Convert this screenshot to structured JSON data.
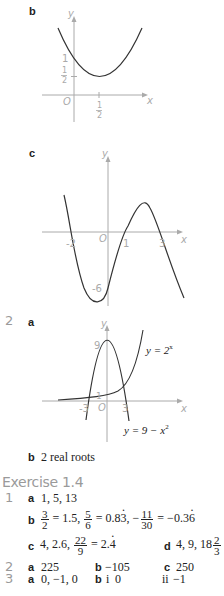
{
  "part_b_graph": {
    "label": "b",
    "y_axis_label": "y",
    "x_axis_label": "x",
    "origin_label": "O",
    "y_tick_1": "1",
    "y_tick_half_num": "1",
    "y_tick_half_den": "2",
    "x_tick_half_num": "1",
    "x_tick_half_den": "2"
  },
  "part_c_graph": {
    "label": "c",
    "y_axis_label": "y",
    "x_axis_label": "x",
    "origin_label": "O",
    "x_ticks": [
      "-2",
      "1",
      "3"
    ],
    "y_tick": "-6"
  },
  "question_2": {
    "number": "2",
    "part_a_label": "a",
    "graph": {
      "y_axis_label": "y",
      "x_axis_label": "x",
      "origin_label": "O",
      "y_tick_9": "9",
      "y_tick_1": "1",
      "x_tick_neg3": "-3",
      "x_tick_3": "3",
      "curve1_label": "y = 2",
      "curve1_sup": "x",
      "curve2_label": "y = 9 − x",
      "curve2_sup": "2"
    },
    "part_b_label": "b",
    "part_b_answer": "2 real roots"
  },
  "exercise": {
    "title": "Exercise 1.4",
    "q1": {
      "number": "1",
      "a_label": "a",
      "a_answer": "1, 5, 13",
      "b_label": "b",
      "b_f1_num": "3",
      "b_f1_den": "2",
      "b_f1_val": " = 1.5, ",
      "b_f2_num": "5",
      "b_f2_den": "6",
      "b_f2_val_pre": " = 0.8",
      "b_f2_val_dot": "3",
      "b_f2_sep": ", −",
      "b_f3_num": "11",
      "b_f3_den": "30",
      "b_f3_val_pre": " = −0.3",
      "b_f3_val_dot": "6",
      "c_label": "c",
      "c_pre": "4, 2.6, ",
      "c_f_num": "22",
      "c_f_den": "9",
      "c_val_pre": " = 2.",
      "c_val_dot": "4",
      "d_label": "d",
      "d_pre": "4, 9, 18",
      "d_f_num": "2",
      "d_f_den": "3"
    },
    "q2": {
      "number": "2",
      "a_label": "a",
      "a_answer": "225",
      "b_label": "b",
      "b_answer": "−105",
      "c_label": "c",
      "c_answer": "250"
    },
    "q3": {
      "number": "3",
      "a_label": "a",
      "a_answer": "0, −1, 0",
      "b_label": "b",
      "b_i_label": "i",
      "b_i_answer": "0",
      "b_ii_label": "ii",
      "b_ii_answer": "−1"
    }
  }
}
